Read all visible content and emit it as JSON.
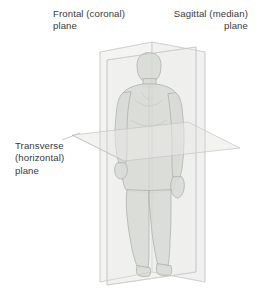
{
  "figure": {
    "background_color": "#ffffff",
    "width": 255,
    "height": 301
  },
  "labels": {
    "frontal": "Frontal (coronal)\nplane",
    "sagittal": "Sagittal (median)\nplane",
    "transverse": "Transverse\n(horizontal)\nplane"
  },
  "colors": {
    "text": "#3a3a3a",
    "plane_fill": "#f0f0ee",
    "plane_stroke": "#c9c9c9",
    "body_fill": "#d7d9d4",
    "body_stroke": "#a8aaa5",
    "leader_line": "#bdbdbd",
    "background": "#ffffff"
  },
  "planes": [
    {
      "name": "frontal-coronal-plane",
      "label": "Frontal (coronal) plane",
      "orientation": "vertical-front-back-division",
      "shape": "rectangle"
    },
    {
      "name": "sagittal-median-plane",
      "label": "Sagittal (median) plane",
      "orientation": "vertical-left-right-division",
      "shape": "bowtie-perspective"
    },
    {
      "name": "transverse-horizontal-plane",
      "label": "Transverse (horizontal) plane",
      "orientation": "horizontal-upper-lower-division",
      "shape": "parallelogram"
    }
  ],
  "subject": {
    "name": "human-figure",
    "description": "Standing human body silhouette, anterior view"
  }
}
